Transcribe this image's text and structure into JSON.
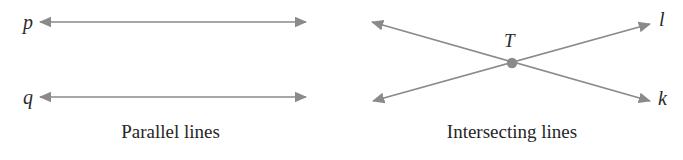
{
  "figure": {
    "background_color": "#ffffff",
    "stroke_color": "#8a8a8a",
    "label_color": "#2b2b2b",
    "caption_color": "#262626",
    "panels": [
      {
        "id": "parallel-lines",
        "caption": "Parallel lines",
        "lines": [
          {
            "name": "p",
            "label": "p",
            "arrowheads": "double",
            "x1": 40,
            "y1": 22,
            "x2": 306,
            "y2": 22
          },
          {
            "name": "q",
            "label": "q",
            "arrowheads": "double",
            "x1": 40,
            "y1": 97,
            "x2": 306,
            "y2": 97
          }
        ],
        "points": []
      },
      {
        "id": "intersecting-lines",
        "caption": "Intersecting lines",
        "lines": [
          {
            "name": "l",
            "label": "l",
            "arrowheads": "double",
            "x1": 373,
            "y1": 101,
            "x2": 650,
            "y2": 24
          },
          {
            "name": "k",
            "label": "k",
            "arrowheads": "double",
            "x1": 372,
            "y1": 22,
            "x2": 650,
            "y2": 101
          }
        ],
        "points": [
          {
            "name": "T",
            "label": "T",
            "x": 512,
            "y": 63,
            "radius": 5
          }
        ]
      }
    ]
  },
  "labels": {
    "p": "p",
    "q": "q",
    "T": "T",
    "l": "l",
    "k": "k"
  },
  "captions": {
    "parallel": "Parallel lines",
    "intersecting": "Intersecting lines"
  }
}
